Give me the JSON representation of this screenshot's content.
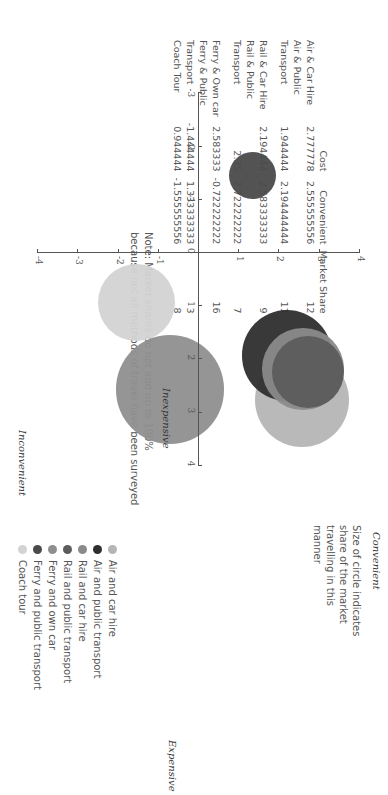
{
  "table": {
    "headers": [
      "",
      "Cost",
      "Convenient",
      "Market Share"
    ],
    "rows": [
      {
        "label_line1": "Air & Car Hire",
        "label_line2": "",
        "cost": "2.777778",
        "convenient": "2.555555556",
        "share": "12"
      },
      {
        "label_line1": "Air & Public",
        "label_line2": "Transport",
        "cost": "1.944444",
        "convenient": "2.194444444",
        "share": "11"
      },
      {
        "label_line1": "Rail & Car Hire",
        "label_line2": "",
        "cost": "2.194444",
        "convenient": "2.583333333",
        "share": "9"
      },
      {
        "label_line1": "Rail & Public",
        "label_line2": "Transport",
        "cost": "2.25",
        "convenient": "2.722222222",
        "share": "7"
      },
      {
        "label_line1": "Ferry & Own car",
        "label_line2": "",
        "cost": "2.583333",
        "convenient": "-0.722222222",
        "share": "16"
      },
      {
        "label_line1": "Ferry & Public",
        "label_line2": "Transport",
        "cost": "-1.444444",
        "convenient": "1.333333333",
        "share": "3"
      },
      {
        "label_line1": "Coach Tour",
        "label_line2": "",
        "cost": "0.944444",
        "convenient": "-1.555555556",
        "share": "8"
      }
    ],
    "note_line1": "Note: Market shares do not add up to 100%",
    "note_line2": "because not all methods of travel have been surveyed"
  },
  "chart_labels": {
    "size_note": [
      "Size of circle indicates",
      "share of the market",
      "travelling in this",
      "manner"
    ],
    "convenient": "Convenient",
    "inconvenient": "Inconvenient",
    "expensive": "Expensive",
    "inexpensive": "Inexpensive"
  },
  "chart_data": {
    "type": "scatter",
    "subtype": "bubble",
    "title": "",
    "xlabel": "Cost (Inexpensive → Expensive)",
    "ylabel": "Convenience (Inconvenient → Convenient)",
    "xlim": [
      -3,
      4
    ],
    "ylim": [
      -4,
      4
    ],
    "x_ticks": [
      "-3",
      "-2",
      "-1",
      "0",
      "1",
      "2",
      "3",
      "4"
    ],
    "y_ticks": [
      "-4",
      "-3",
      "-2",
      "-1",
      "0",
      "1",
      "2",
      "3",
      "4"
    ],
    "grid": false,
    "legend_position": "below",
    "series": [
      {
        "name": "Air and car hire",
        "x": 2.777778,
        "y": 2.555555556,
        "size": 12,
        "color": "#b5b5b5"
      },
      {
        "name": "Air and public transport",
        "x": 1.944444,
        "y": 2.194444444,
        "size": 11,
        "color": "#2e2e2e"
      },
      {
        "name": "Rail and car hire",
        "x": 2.194444,
        "y": 2.583333333,
        "size": 9,
        "color": "#8a8a8a"
      },
      {
        "name": "Rail and public transport",
        "x": 2.25,
        "y": 2.722222222,
        "size": 7,
        "color": "#5c5c5c"
      },
      {
        "name": "Ferry and own car",
        "x": 2.583333,
        "y": -0.722222222,
        "size": 16,
        "color": "#8f8f8f"
      },
      {
        "name": "Ferry and public transport",
        "x": -1.444444,
        "y": 1.333333333,
        "size": 3,
        "color": "#4a4a4a"
      },
      {
        "name": "Coach tour",
        "x": 0.944444,
        "y": -1.555555556,
        "size": 8,
        "color": "#d3d3d3"
      }
    ]
  }
}
